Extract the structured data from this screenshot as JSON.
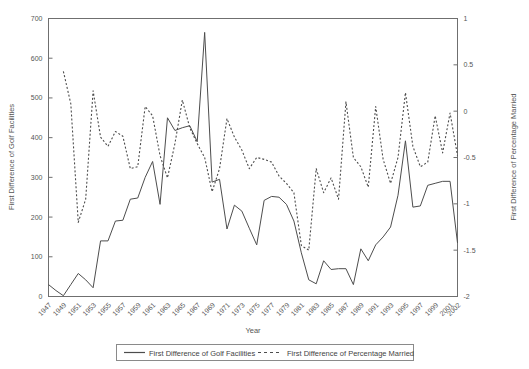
{
  "chart_data": {
    "type": "line",
    "title": "",
    "xlabel": "Year",
    "ylabel": "First Difference of Golf Facilities",
    "y2label": "First Difference of Percentage Married",
    "grid": false,
    "legend_position": "bottom",
    "xlim": [
      1947,
      2002
    ],
    "ylim": [
      0,
      700
    ],
    "y2lim": [
      -2,
      1
    ],
    "ytick_labels": [
      "0",
      "100",
      "200",
      "300",
      "400",
      "500",
      "600",
      "700"
    ],
    "ytick_values": [
      0,
      100,
      200,
      300,
      400,
      500,
      600,
      700
    ],
    "y2tick_labels": [
      "-2",
      "-1.5",
      "-1",
      "-0.5",
      "0",
      "0.5",
      "1"
    ],
    "y2tick_values": [
      -2,
      -1.5,
      -1,
      -0.5,
      0,
      0.5,
      1
    ],
    "xtick_labels": [
      "1947",
      "1949",
      "1951",
      "1953",
      "1955",
      "1957",
      "1959",
      "1961",
      "1963",
      "1965",
      "1967",
      "1969",
      "1971",
      "1973",
      "1975",
      "1977",
      "1979",
      "1981",
      "1983",
      "1985",
      "1987",
      "1989",
      "1991",
      "1993",
      "1995",
      "1997",
      "1999",
      "2001",
      "2002"
    ],
    "xtick_values": [
      1947,
      1949,
      1951,
      1953,
      1955,
      1957,
      1959,
      1961,
      1963,
      1965,
      1967,
      1969,
      1971,
      1973,
      1975,
      1977,
      1979,
      1981,
      1983,
      1985,
      1987,
      1989,
      1991,
      1993,
      1995,
      1997,
      1999,
      2001,
      2002
    ],
    "x": [
      1947,
      1948,
      1949,
      1950,
      1951,
      1952,
      1953,
      1954,
      1955,
      1956,
      1957,
      1958,
      1959,
      1960,
      1961,
      1962,
      1963,
      1964,
      1965,
      1966,
      1967,
      1968,
      1969,
      1970,
      1971,
      1972,
      1973,
      1974,
      1975,
      1976,
      1977,
      1978,
      1979,
      1980,
      1981,
      1982,
      1983,
      1984,
      1985,
      1986,
      1987,
      1988,
      1989,
      1990,
      1991,
      1992,
      1993,
      1994,
      1995,
      1996,
      1997,
      1998,
      1999,
      2000,
      2001,
      2002
    ],
    "series": [
      {
        "name": "First Difference of Golf Facilities",
        "axis": "left",
        "style": "solid",
        "color": "#4d4d4d",
        "values": [
          30,
          15,
          2,
          30,
          58,
          42,
          22,
          140,
          140,
          190,
          192,
          245,
          248,
          300,
          340,
          232,
          450,
          418,
          425,
          430,
          390,
          665,
          288,
          295,
          170,
          230,
          215,
          172,
          130,
          242,
          252,
          250,
          232,
          190,
          110,
          42,
          32,
          90,
          68,
          70,
          70,
          30,
          120,
          90,
          130,
          150,
          175,
          255,
          392,
          225,
          228,
          280,
          285,
          290,
          290,
          135
        ]
      },
      {
        "name": "First Difference of Percentage Married",
        "axis": "right",
        "style": "dashed",
        "color": "#4d4d4d",
        "values": [
          null,
          null,
          0.43,
          0.08,
          -1.2,
          -0.95,
          0.22,
          -0.28,
          -0.38,
          -0.22,
          -0.27,
          -0.62,
          -0.6,
          0.05,
          -0.05,
          -0.48,
          -0.72,
          -0.35,
          0.12,
          -0.18,
          -0.35,
          -0.5,
          -0.87,
          -0.62,
          -0.08,
          -0.28,
          -0.42,
          -0.62,
          -0.5,
          -0.52,
          -0.55,
          -0.7,
          -0.78,
          -0.88,
          -1.45,
          -1.5,
          -0.62,
          -0.88,
          -0.72,
          -0.95,
          0.1,
          -0.5,
          -0.6,
          -0.82,
          0.05,
          -0.52,
          -0.78,
          -0.5,
          0.2,
          -0.38,
          -0.6,
          -0.55,
          -0.05,
          -0.45,
          -0.02,
          -0.48
        ]
      }
    ],
    "legend": [
      {
        "label": "First Difference of Golf Facilities",
        "style": "solid"
      },
      {
        "label": "First Difference of Percentage Married",
        "style": "dashed"
      }
    ]
  }
}
